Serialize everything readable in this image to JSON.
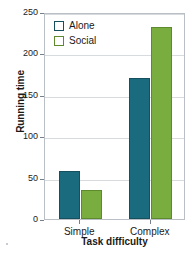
{
  "chart_data": {
    "type": "bar",
    "title": "",
    "xlabel": "Task difficulty",
    "ylabel": "Running time",
    "categories": [
      "Simple",
      "Complex"
    ],
    "series": [
      {
        "name": "Alone",
        "values": [
          58,
          170
        ],
        "color": "#1b6b7e"
      },
      {
        "name": "Social",
        "values": [
          35,
          232
        ],
        "color": "#7aad3f"
      }
    ],
    "ylim": [
      0,
      250
    ],
    "yticks": [
      0,
      50,
      100,
      150,
      200,
      250
    ],
    "ytick_labels": [
      "0",
      "50",
      "100",
      "150",
      "200",
      "250"
    ],
    "grid": true,
    "grid_axis": "y",
    "legend_position": "top-left"
  },
  "legend": {
    "entries": [
      {
        "label": "Alone",
        "swatch": "legend-swatch-alone"
      },
      {
        "label": "Social",
        "swatch": "legend-swatch-social"
      }
    ]
  },
  "colors": {
    "alone": "#1b6b7e",
    "alone_edge": "#16505f",
    "social": "#7aad3f",
    "social_edge": "#5d8a2d",
    "grid": "#d7dbde",
    "frame": "#b9bfc4",
    "text": "#1a1a1a"
  }
}
